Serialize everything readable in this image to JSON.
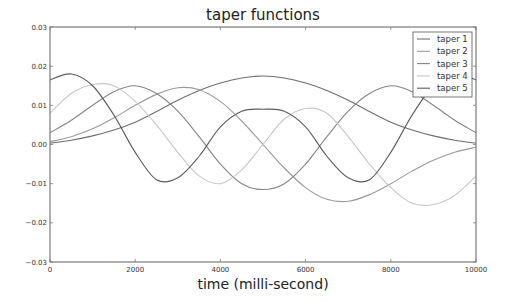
{
  "chart_data": {
    "type": "line",
    "title": "taper functions",
    "xlabel": "time (milli-second)",
    "ylabel": "",
    "xlim": [
      0,
      10000
    ],
    "ylim": [
      -0.03,
      0.03
    ],
    "xticks": [
      0,
      2000,
      4000,
      6000,
      8000,
      10000
    ],
    "xtick_labels": [
      "0",
      "2000",
      "4000",
      "6000",
      "8000",
      "10000"
    ],
    "yticks": [
      0.03,
      0.02,
      0.01,
      0.0,
      -0.01,
      -0.02,
      -0.03
    ],
    "ytick_labels": [
      "0.03",
      "0.02",
      "0.01",
      "0.00",
      "−0.01",
      "−0.02",
      "−0.03"
    ],
    "grid": false,
    "legend_position": "upper right",
    "x": [
      0,
      500,
      1000,
      1500,
      2000,
      2500,
      3000,
      3500,
      4000,
      4500,
      5000,
      5500,
      6000,
      6500,
      7000,
      7500,
      8000,
      8500,
      9000,
      9500,
      10000
    ],
    "series": [
      {
        "name": "taper 1",
        "color": "#6e6e6e",
        "values": [
          0.0003,
          0.0011,
          0.0022,
          0.0037,
          0.0057,
          0.0084,
          0.0113,
          0.0138,
          0.0157,
          0.017,
          0.0175,
          0.017,
          0.0157,
          0.0138,
          0.0113,
          0.0084,
          0.0057,
          0.0037,
          0.0022,
          0.0011,
          0.0003
        ]
      },
      {
        "name": "taper 2",
        "color": "#9a9a9a",
        "values": [
          0.0007,
          0.002,
          0.004,
          0.0068,
          0.01,
          0.0128,
          0.0145,
          0.014,
          0.011,
          0.006,
          0.0,
          -0.006,
          -0.011,
          -0.014,
          -0.0145,
          -0.0128,
          -0.01,
          -0.0068,
          -0.004,
          -0.002,
          -0.0007
        ]
      },
      {
        "name": "taper 3",
        "color": "#858585",
        "values": [
          0.003,
          0.0062,
          0.01,
          0.0135,
          0.015,
          0.013,
          0.0085,
          0.002,
          -0.005,
          -0.01,
          -0.0115,
          -0.01,
          -0.005,
          0.002,
          0.0085,
          0.013,
          0.015,
          0.0135,
          0.01,
          0.0062,
          0.003
        ]
      },
      {
        "name": "taper 4",
        "color": "#c8c8c8",
        "values": [
          0.008,
          0.013,
          0.0153,
          0.015,
          0.011,
          0.005,
          -0.002,
          -0.008,
          -0.01,
          -0.0065,
          0.0,
          0.0065,
          0.0092,
          0.008,
          0.002,
          -0.005,
          -0.011,
          -0.015,
          -0.0153,
          -0.013,
          -0.008
        ]
      },
      {
        "name": "taper 5",
        "color": "#5c5c5c",
        "values": [
          0.0165,
          0.018,
          0.015,
          0.0075,
          -0.002,
          -0.009,
          -0.0085,
          -0.003,
          0.0045,
          0.0085,
          0.009,
          0.0085,
          0.0045,
          -0.003,
          -0.0085,
          -0.009,
          -0.002,
          0.0075,
          0.015,
          0.018,
          0.0165
        ]
      }
    ]
  }
}
